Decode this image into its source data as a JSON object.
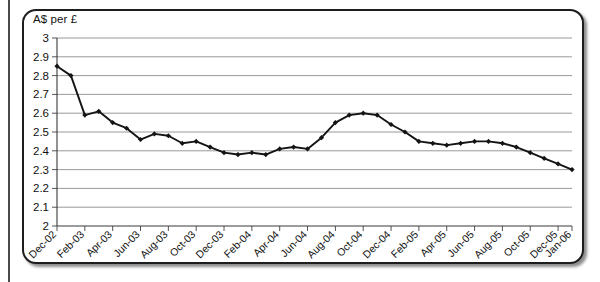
{
  "figure": {
    "axis_title": "A$ per £",
    "frame_color": "#1d1d1d",
    "series_color": "#141414",
    "grid_color": "#8d8d8d"
  },
  "chart_data": {
    "type": "line",
    "title": "",
    "subtitle": "",
    "xlabel": "",
    "ylabel": "A$ per £",
    "ylim": [
      2,
      3
    ],
    "ytick_step": 0.1,
    "grid": true,
    "legend": false,
    "legend_position": "none",
    "ytick_labels": [
      "2",
      "2.1",
      "2.2",
      "2.3",
      "2.4",
      "2.5",
      "2.6",
      "2.7",
      "2.8",
      "2.9",
      "3"
    ],
    "ytick_values": [
      2,
      2.1,
      2.2,
      2.3,
      2.4,
      2.5,
      2.6,
      2.7,
      2.8,
      2.9,
      3
    ],
    "xtick_labels": [
      "Dec-02",
      "Feb-03",
      "Apr-03",
      "Jun-03",
      "Aug-03",
      "Oct-03",
      "Dec-03",
      "Feb-04",
      "Apr-04",
      "Jun-04",
      "Aug-04",
      "Oct-04",
      "Dec-04",
      "Feb-05",
      "Apr-05",
      "Jun-05",
      "Aug-05",
      "Oct-05",
      "Dec-05",
      "Jan-06"
    ],
    "xtick_indices": [
      0,
      2,
      4,
      6,
      8,
      10,
      12,
      14,
      16,
      18,
      20,
      22,
      24,
      26,
      28,
      30,
      32,
      34,
      36,
      37
    ],
    "x": [
      "Dec-02",
      "Jan-03",
      "Feb-03",
      "Mar-03",
      "Apr-03",
      "May-03",
      "Jun-03",
      "Jul-03",
      "Aug-03",
      "Sep-03",
      "Oct-03",
      "Nov-03",
      "Dec-03",
      "Jan-04",
      "Feb-04",
      "Mar-04",
      "Apr-04",
      "May-04",
      "Jun-04",
      "Jul-04",
      "Aug-04",
      "Sep-04",
      "Oct-04",
      "Nov-04",
      "Dec-04",
      "Jan-05",
      "Feb-05",
      "Mar-05",
      "Apr-05",
      "May-05",
      "Jun-05",
      "Jul-05",
      "Aug-05",
      "Sep-05",
      "Oct-05",
      "Nov-05",
      "Dec-05",
      "Jan-06"
    ],
    "values": [
      2.85,
      2.8,
      2.59,
      2.61,
      2.55,
      2.52,
      2.46,
      2.49,
      2.48,
      2.44,
      2.45,
      2.42,
      2.39,
      2.38,
      2.39,
      2.38,
      2.41,
      2.42,
      2.41,
      2.47,
      2.55,
      2.59,
      2.6,
      2.59,
      2.54,
      2.5,
      2.45,
      2.44,
      2.43,
      2.44,
      2.45,
      2.45,
      2.44,
      2.42,
      2.39,
      2.36,
      2.33,
      2.3
    ],
    "series_name": "A$ per £",
    "y_axis_at": 2,
    "marker": "diamond"
  }
}
